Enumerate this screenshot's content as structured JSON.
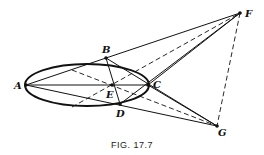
{
  "figure": {
    "caption": "FIG. 17.7",
    "labels": {
      "A": "A",
      "B": "B",
      "C": "C",
      "D": "D",
      "E": "E",
      "F": "F",
      "G": "G"
    }
  }
}
